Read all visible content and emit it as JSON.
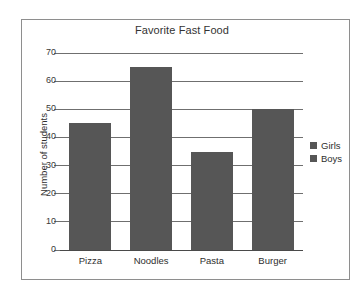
{
  "chart_data": {
    "type": "bar",
    "title": "Favorite Fast Food",
    "xlabel": "",
    "ylabel": "Number of students",
    "categories": [
      "Pizza",
      "Noodles",
      "Pasta",
      "Burger"
    ],
    "values": [
      45,
      65,
      35,
      50
    ],
    "series": [
      {
        "name": "Girls",
        "values": [
          45,
          65,
          35,
          50
        ]
      }
    ],
    "legend": [
      "Girls",
      "Boys"
    ],
    "legend_position": "right",
    "ylim": [
      0,
      70
    ],
    "yticks": [
      0,
      10,
      20,
      30,
      40,
      50,
      60,
      70
    ],
    "ytick_labels": [
      "0",
      "10",
      "20",
      "30",
      "40",
      "50",
      "60",
      "70"
    ],
    "grid": true,
    "colors": {
      "bar": "#565656",
      "gridline": "#6f6f6f",
      "frame": "#8e8e8e",
      "text": "#2e2e2e",
      "background": "#ffffff"
    }
  }
}
